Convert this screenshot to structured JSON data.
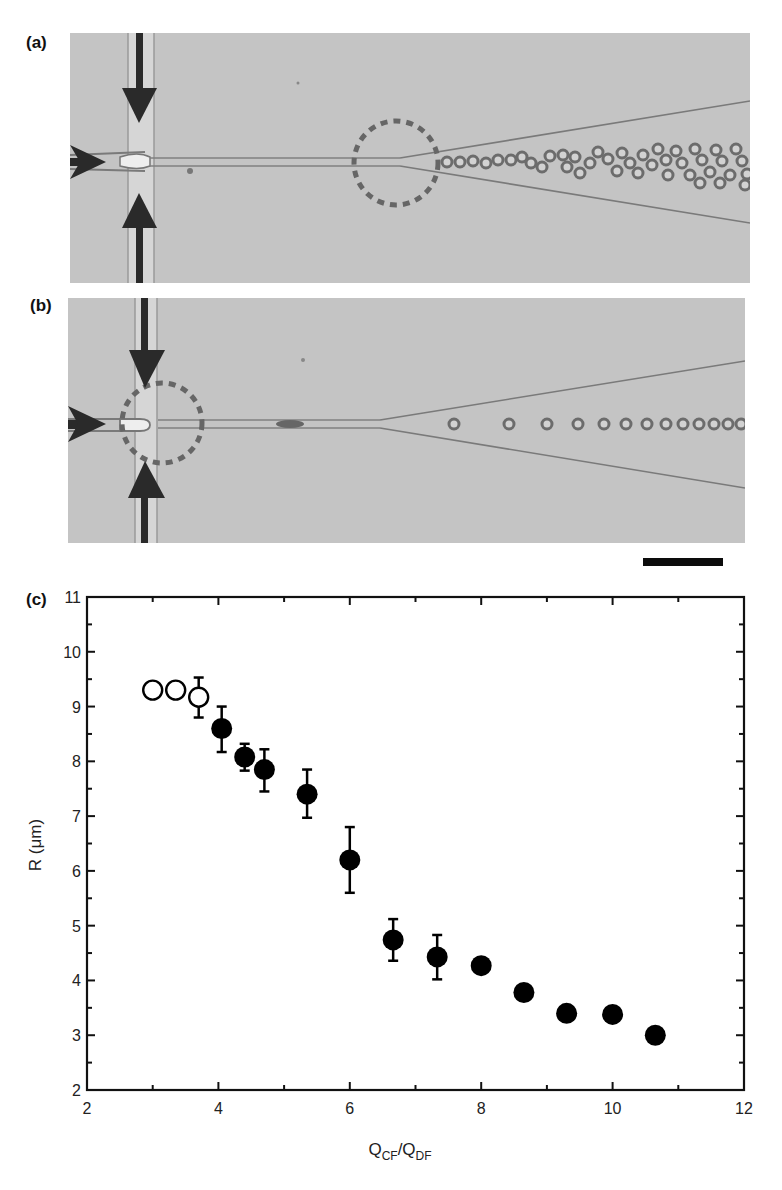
{
  "figure": {
    "panels": [
      {
        "id": "a",
        "label": "(a)",
        "description": "Micrograph of flow-focusing junction; dashed circle marks droplet breakup downstream in expanding channel; polydisperse crowded droplets"
      },
      {
        "id": "b",
        "label": "(b)",
        "description": "Micrograph of flow-focusing junction; dashed circle marks droplet breakup at the junction; monodisperse droplet train"
      },
      {
        "id": "c",
        "label": "(c)",
        "description": "Droplet radius vs flow-rate ratio"
      }
    ],
    "scale_bar": {
      "visible": true,
      "label": ""
    },
    "colors": {
      "micrograph_bg": "#c4c4c4",
      "channel_wall": "#7a7a7a",
      "arrow": "#2a2a2a",
      "dashed_circle": "#666666",
      "marker": "#000000",
      "frame": "#111111"
    }
  },
  "chart_data": {
    "type": "scatter",
    "title": "",
    "panel_label": "(c)",
    "xlabel": "Q_CF/Q_DF",
    "xlabel_parts": {
      "main1": "Q",
      "sub1": "CF",
      "sep": "/",
      "main2": "Q",
      "sub2": "DF"
    },
    "ylabel": "R (μm)",
    "xlim": [
      2,
      12
    ],
    "ylim": [
      2,
      11
    ],
    "x_ticks": [
      2,
      4,
      6,
      8,
      10,
      12
    ],
    "y_ticks": [
      2,
      3,
      4,
      5,
      6,
      7,
      8,
      9,
      10,
      11
    ],
    "grid": false,
    "legend": null,
    "series": [
      {
        "name": "open circles (breakup downstream)",
        "marker": "open-circle",
        "x": [
          3.0,
          3.35,
          3.7
        ],
        "y": [
          9.3,
          9.3,
          9.17
        ],
        "err_low": [
          null,
          null,
          8.8
        ],
        "err_high": [
          null,
          null,
          9.53
        ]
      },
      {
        "name": "filled circles (breakup at junction)",
        "marker": "filled-circle",
        "x": [
          4.05,
          4.4,
          4.7,
          5.35,
          6.0,
          6.66,
          7.33,
          8.0,
          8.65,
          9.3,
          10.0,
          10.65
        ],
        "y": [
          8.6,
          8.08,
          7.85,
          7.4,
          6.2,
          4.74,
          4.43,
          4.27,
          3.78,
          3.4,
          3.38,
          3.0
        ],
        "err_low": [
          8.17,
          7.83,
          7.45,
          6.97,
          5.6,
          4.36,
          4.02,
          null,
          null,
          null,
          null,
          null
        ],
        "err_high": [
          9.0,
          8.32,
          8.22,
          7.85,
          6.8,
          5.12,
          4.83,
          null,
          null,
          null,
          null,
          null
        ]
      }
    ]
  }
}
